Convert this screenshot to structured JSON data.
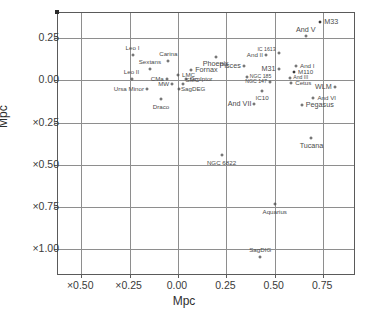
{
  "chart_data": {
    "type": "scatter",
    "title": "",
    "xlabel": "Mpc",
    "ylabel": "Mpc",
    "xlim": [
      -0.62,
      0.92
    ],
    "ylim": [
      -1.16,
      0.4
    ],
    "xticks": [
      "×0.50",
      "×0.25",
      "0.00",
      "0.25",
      "0.50",
      "0.75"
    ],
    "xtick_values": [
      -0.5,
      -0.25,
      0.0,
      0.25,
      0.5,
      0.75
    ],
    "yticks": [
      "0.25",
      "0.00",
      "×0.25",
      "×0.50",
      "×0.75",
      "×1.00"
    ],
    "ytick_values": [
      0.25,
      0.0,
      -0.25,
      -0.5,
      -0.75,
      -1.0
    ],
    "grid": true,
    "legend": null,
    "points": [
      {
        "label": "M33",
        "x": 0.735,
        "y": 0.345,
        "filled": true,
        "pos": "l",
        "size": "big",
        "dx": 4,
        "dy": 0
      },
      {
        "label": "And V",
        "x": 0.66,
        "y": 0.262,
        "filled": false,
        "pos": "c",
        "size": "big",
        "dx": 0,
        "dy": -6
      },
      {
        "label": "Leo I",
        "x": -0.235,
        "y": 0.152,
        "filled": false,
        "pos": "c",
        "size": "",
        "dx": 0,
        "dy": -7
      },
      {
        "label": "Carina",
        "x": -0.05,
        "y": 0.118,
        "filled": false,
        "pos": "c",
        "size": "",
        "dx": 0,
        "dy": -7
      },
      {
        "label": "Phoenix",
        "x": 0.195,
        "y": 0.14,
        "filled": false,
        "pos": "c",
        "size": "big",
        "dx": 0,
        "dy": 7
      },
      {
        "label": "And II",
        "x": 0.455,
        "y": 0.152,
        "filled": false,
        "pos": "r",
        "size": "",
        "dx": -3,
        "dy": 0
      },
      {
        "label": "IC 1613",
        "x": 0.52,
        "y": 0.16,
        "filled": false,
        "pos": "r",
        "size": "tiny",
        "dx": -3,
        "dy": -3
      },
      {
        "label": "And I",
        "x": 0.61,
        "y": 0.085,
        "filled": false,
        "pos": "l",
        "size": "",
        "dx": 4,
        "dy": 0
      },
      {
        "label": "Sextans",
        "x": -0.145,
        "y": 0.068,
        "filled": false,
        "pos": "c",
        "size": "",
        "dx": 0,
        "dy": -7
      },
      {
        "label": "Pisces",
        "x": 0.34,
        "y": 0.085,
        "filled": false,
        "pos": "r",
        "size": "big",
        "dx": -3,
        "dy": 0
      },
      {
        "label": "M31",
        "x": 0.52,
        "y": 0.068,
        "filled": false,
        "pos": "r",
        "size": "big",
        "dx": -3,
        "dy": 0
      },
      {
        "label": "M110",
        "x": 0.6,
        "y": 0.048,
        "filled": true,
        "pos": "l",
        "size": "",
        "dx": 4,
        "dy": 0
      },
      {
        "label": "Fornax",
        "x": 0.068,
        "y": 0.062,
        "filled": false,
        "pos": "l",
        "size": "big",
        "dx": 4,
        "dy": 0
      },
      {
        "label": "Leo II",
        "x": -0.24,
        "y": 0.01,
        "filled": false,
        "pos": "c",
        "size": "",
        "dx": 0,
        "dy": -7
      },
      {
        "label": "LMC",
        "x": 0.0,
        "y": 0.03,
        "filled": false,
        "pos": "l",
        "size": "",
        "dx": 4,
        "dy": 0
      },
      {
        "label": "CMa",
        "x": -0.058,
        "y": 0.008,
        "filled": false,
        "pos": "r",
        "size": "",
        "dx": -3,
        "dy": 0
      },
      {
        "label": "Sculptor",
        "x": 0.04,
        "y": 0.008,
        "filled": false,
        "pos": "l",
        "size": "",
        "dx": 4,
        "dy": 0
      },
      {
        "label": "NGC 185",
        "x": 0.355,
        "y": 0.02,
        "filled": false,
        "pos": "l",
        "size": "tiny",
        "dx": 3,
        "dy": 0
      },
      {
        "label": "And III",
        "x": 0.58,
        "y": 0.012,
        "filled": false,
        "pos": "l",
        "size": "tiny",
        "dx": 3,
        "dy": 0
      },
      {
        "label": "NGC 147",
        "x": 0.475,
        "y": -0.008,
        "filled": false,
        "pos": "r",
        "size": "tiny",
        "dx": -3,
        "dy": 0
      },
      {
        "label": "Cetus",
        "x": 0.585,
        "y": -0.018,
        "filled": false,
        "pos": "l",
        "size": "",
        "dx": 4,
        "dy": 0
      },
      {
        "label": "MW",
        "x": -0.03,
        "y": -0.022,
        "filled": false,
        "pos": "r",
        "size": "",
        "dx": -3,
        "dy": 0
      },
      {
        "label": "SMC",
        "x": 0.028,
        "y": -0.02,
        "filled": false,
        "pos": "l",
        "size": "",
        "dx": 2,
        "dy": -4
      },
      {
        "label": "SagDEG",
        "x": 0.005,
        "y": -0.052,
        "filled": false,
        "pos": "l",
        "size": "",
        "dx": 2,
        "dy": 0
      },
      {
        "label": "IC10",
        "x": 0.435,
        "y": -0.06,
        "filled": false,
        "pos": "c",
        "size": "",
        "dx": 0,
        "dy": 7
      },
      {
        "label": "WLM",
        "x": 0.81,
        "y": -0.04,
        "filled": false,
        "pos": "r",
        "size": "big",
        "dx": -3,
        "dy": 0
      },
      {
        "label": "Ursa Minor",
        "x": -0.16,
        "y": -0.052,
        "filled": false,
        "pos": "r",
        "size": "",
        "dx": -3,
        "dy": 0
      },
      {
        "label": "And VI",
        "x": 0.7,
        "y": -0.105,
        "filled": false,
        "pos": "l",
        "size": "",
        "dx": 4,
        "dy": 0
      },
      {
        "label": "And VII",
        "x": 0.395,
        "y": -0.14,
        "filled": false,
        "pos": "r",
        "size": "big",
        "dx": -3,
        "dy": 0
      },
      {
        "label": "Pegasus",
        "x": 0.64,
        "y": -0.145,
        "filled": false,
        "pos": "l",
        "size": "big",
        "dx": 4,
        "dy": 0
      },
      {
        "label": "Draco",
        "x": -0.088,
        "y": -0.112,
        "filled": false,
        "pos": "c",
        "size": "",
        "dx": 0,
        "dy": 8
      },
      {
        "label": "Tucana",
        "x": 0.69,
        "y": -0.34,
        "filled": false,
        "pos": "c",
        "size": "big",
        "dx": 0,
        "dy": 8
      },
      {
        "label": "NGC 6822",
        "x": 0.225,
        "y": -0.44,
        "filled": false,
        "pos": "c",
        "size": "",
        "dx": 0,
        "dy": 8
      },
      {
        "label": "Aquarius",
        "x": 0.5,
        "y": -0.735,
        "filled": false,
        "pos": "c",
        "size": "",
        "dx": 0,
        "dy": 8
      },
      {
        "label": "SagDIG",
        "x": 0.425,
        "y": -1.045,
        "filled": false,
        "pos": "c",
        "size": "",
        "dx": 0,
        "dy": -7
      }
    ]
  }
}
